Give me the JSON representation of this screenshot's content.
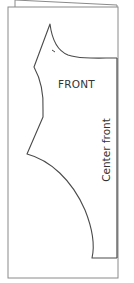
{
  "diagram": {
    "type": "sewing-pattern-piece",
    "labels": {
      "piece_name": "FRONT",
      "grain_edge": "Center front"
    },
    "colors": {
      "line": "#4a4a4a",
      "paper_edge": "#8a8a8a",
      "text": "#333333",
      "background": "#ffffff"
    }
  }
}
